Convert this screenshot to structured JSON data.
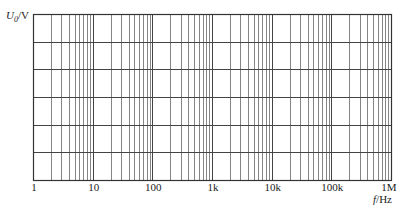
{
  "chart_data": {
    "type": "line",
    "title": "",
    "xlabel": "f/Hz",
    "ylabel": "U0/V",
    "xscale": "log",
    "xlim": [
      1,
      1000000
    ],
    "x_ticks": [
      1,
      10,
      100,
      1000,
      10000,
      100000,
      1000000
    ],
    "x_tick_labels": [
      "1",
      "10",
      "100",
      "1k",
      "10k",
      "100k",
      "1M"
    ],
    "y_ticks": [],
    "y_rows": 6,
    "grid": true,
    "minor_grid": "log subdivisions 2-9 per decade",
    "series": [],
    "legend": null
  },
  "labels": {
    "y_symbol": "U",
    "y_sub": "0",
    "y_unit": "/V",
    "x_symbol": "f",
    "x_unit": "/Hz"
  },
  "colors": {
    "frame": "#333333",
    "major": "#444444",
    "minor": "#666666",
    "text": "#222222"
  }
}
